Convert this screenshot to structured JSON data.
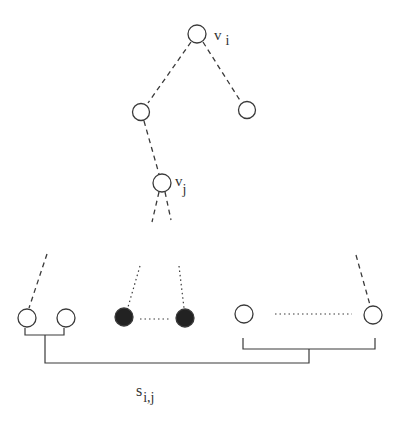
{
  "diagram": {
    "type": "tree-diagram",
    "colors": {
      "stroke": "#3a3a3a",
      "filled_node": "#222222",
      "background": "#ffffff"
    },
    "labels": {
      "root": {
        "main": "v",
        "sub": "i"
      },
      "inner": {
        "main": "v",
        "sub": "j"
      },
      "set": {
        "main": "s",
        "sub": "i,j"
      }
    },
    "nodes": [
      {
        "id": "v_i",
        "x": 197,
        "y": 34,
        "filled": false
      },
      {
        "id": "left-child",
        "x": 141,
        "y": 112,
        "filled": false
      },
      {
        "id": "right-child",
        "x": 247,
        "y": 110,
        "filled": false
      },
      {
        "id": "v_j",
        "x": 162,
        "y": 183,
        "filled": false
      },
      {
        "id": "leaf-1",
        "x": 27,
        "y": 318,
        "filled": false
      },
      {
        "id": "leaf-2",
        "x": 66,
        "y": 318,
        "filled": false
      },
      {
        "id": "leaf-filled-1",
        "x": 124,
        "y": 317,
        "filled": true
      },
      {
        "id": "leaf-filled-2",
        "x": 185,
        "y": 318,
        "filled": true
      },
      {
        "id": "leaf-3",
        "x": 244,
        "y": 314,
        "filled": false
      },
      {
        "id": "leaf-4",
        "x": 373,
        "y": 315,
        "filled": false
      }
    ]
  }
}
